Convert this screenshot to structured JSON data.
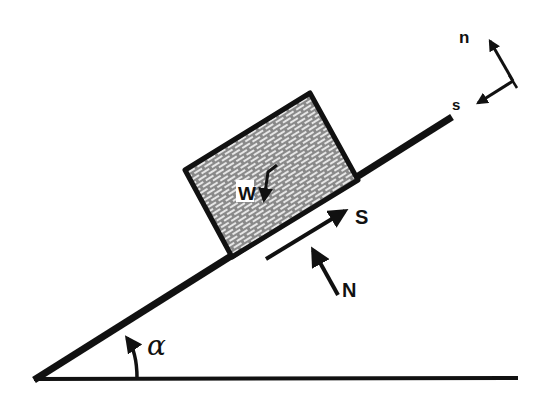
{
  "diagram": {
    "type": "inclined-plane-free-body",
    "colors": {
      "line": "#111111",
      "block_fill": "#8a8a8a",
      "brick_mortar": "#e6e6e6",
      "background": "#ffffff"
    },
    "labels": {
      "weight": "W",
      "friction_force": "S",
      "normal_force": "N",
      "angle": "α",
      "axis_normal": "n",
      "axis_slope": "s"
    }
  }
}
